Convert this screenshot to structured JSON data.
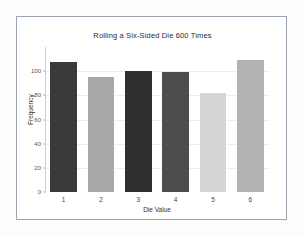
{
  "chart_data": {
    "type": "bar",
    "title": "Rolling a Six-Sided Die 600 Times",
    "xlabel": "Die Value",
    "ylabel": "Frequency",
    "categories": [
      "1",
      "2",
      "3",
      "4",
      "5",
      "6"
    ],
    "values": [
      108,
      95,
      100,
      99,
      82,
      109
    ],
    "bar_colors": [
      "#3a3a3a",
      "#a8a8a8",
      "#2f2f2f",
      "#4d4d4d",
      "#d6d6d6",
      "#b2b2b2"
    ],
    "ylim": [
      0,
      120
    ],
    "yticks": [
      0,
      20,
      40,
      60,
      80,
      100
    ],
    "ytick_labels": [
      "0",
      "20",
      "40",
      "60",
      "80",
      "100"
    ],
    "grid": true,
    "grid_axis": "y",
    "legend": false,
    "legend_position": "none",
    "bar_width_ratio": 0.72,
    "axis_color": "#cfcfcf",
    "frame_color": "#9aa3b0",
    "background": "#ffffff"
  }
}
